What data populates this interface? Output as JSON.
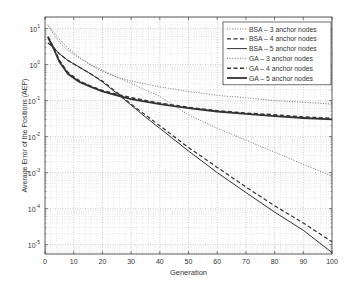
{
  "chart_data": {
    "type": "line",
    "title": "",
    "xlabel": "Generation",
    "ylabel": "Average Error of the Positions (AEP)",
    "xscale": "linear",
    "yscale": "log",
    "xlim": [
      0,
      100
    ],
    "ylim": [
      5.5e-06,
      21
    ],
    "xticks": [
      0,
      10,
      20,
      30,
      40,
      50,
      60,
      70,
      80,
      90,
      100
    ],
    "yticks": [
      {
        "value": 10,
        "label_base": "10",
        "label_exp": "1"
      },
      {
        "value": 1,
        "label_base": "10",
        "label_exp": "0"
      },
      {
        "value": 0.1,
        "label_base": "10",
        "label_exp": "-1"
      },
      {
        "value": 0.01,
        "label_base": "10",
        "label_exp": "-2"
      },
      {
        "value": 0.001,
        "label_base": "10",
        "label_exp": "-3"
      },
      {
        "value": 0.0001,
        "label_base": "10",
        "label_exp": "-4"
      },
      {
        "value": 1e-05,
        "label_base": "10",
        "label_exp": "-5"
      }
    ],
    "grid": true,
    "legend_position": "upper right",
    "series": [
      {
        "name": "BSA – 3 anchor nodes",
        "style": "dotted",
        "width": 0.9,
        "x": [
          1,
          3,
          5,
          8,
          12,
          16,
          20,
          25,
          30,
          40,
          50,
          60,
          70,
          80,
          90,
          100
        ],
        "values": [
          12,
          7,
          4.2,
          2.5,
          1.5,
          1.0,
          0.7,
          0.45,
          0.3,
          0.13,
          0.04,
          0.017,
          0.008,
          0.0037,
          0.0017,
          0.0008
        ]
      },
      {
        "name": "BSA – 4 anchor nodes",
        "style": "dashed",
        "width": 1.2,
        "x": [
          1,
          3,
          5,
          8,
          12,
          16,
          20,
          25,
          30,
          35,
          40,
          50,
          60,
          70,
          80,
          90,
          100
        ],
        "values": [
          4.0,
          3.0,
          2.0,
          1.3,
          0.85,
          0.55,
          0.35,
          0.17,
          0.08,
          0.04,
          0.02,
          0.005,
          0.0014,
          0.0004,
          0.00012,
          4e-05,
          1.2e-05
        ]
      },
      {
        "name": "BSA – 5 anchor nodes",
        "style": "solid",
        "width": 1.0,
        "x": [
          1,
          3,
          5,
          8,
          12,
          16,
          20,
          25,
          30,
          35,
          40,
          50,
          60,
          70,
          80,
          90,
          100
        ],
        "values": [
          4.0,
          3.0,
          2.0,
          1.3,
          0.85,
          0.55,
          0.33,
          0.16,
          0.075,
          0.035,
          0.017,
          0.004,
          0.001,
          0.00028,
          8e-05,
          2.5e-05,
          6e-06
        ]
      },
      {
        "name": "GA – 3 anchor nodes",
        "style": "dotted",
        "width": 0.9,
        "x": [
          1,
          3,
          5,
          8,
          12,
          16,
          20,
          25,
          30,
          40,
          50,
          60,
          70,
          80,
          90,
          100
        ],
        "values": [
          13,
          8,
          5,
          2.9,
          1.6,
          0.95,
          0.65,
          0.45,
          0.35,
          0.24,
          0.18,
          0.14,
          0.12,
          0.1,
          0.09,
          0.08
        ]
      },
      {
        "name": "GA – 4 anchor nodes",
        "style": "dashed",
        "width": 1.6,
        "x": [
          1,
          3,
          5,
          8,
          12,
          16,
          20,
          25,
          30,
          40,
          50,
          60,
          70,
          80,
          90,
          100
        ],
        "values": [
          6.0,
          3.0,
          1.3,
          0.6,
          0.35,
          0.25,
          0.19,
          0.15,
          0.12,
          0.085,
          0.065,
          0.052,
          0.045,
          0.04,
          0.035,
          0.032
        ]
      },
      {
        "name": "GA – 5 anchor nodes",
        "style": "solid",
        "width": 1.8,
        "x": [
          1,
          3,
          5,
          8,
          12,
          16,
          20,
          25,
          30,
          40,
          50,
          60,
          70,
          80,
          90,
          100
        ],
        "values": [
          5.8,
          2.8,
          1.2,
          0.55,
          0.33,
          0.24,
          0.18,
          0.14,
          0.11,
          0.08,
          0.062,
          0.05,
          0.043,
          0.037,
          0.033,
          0.03
        ]
      }
    ]
  }
}
